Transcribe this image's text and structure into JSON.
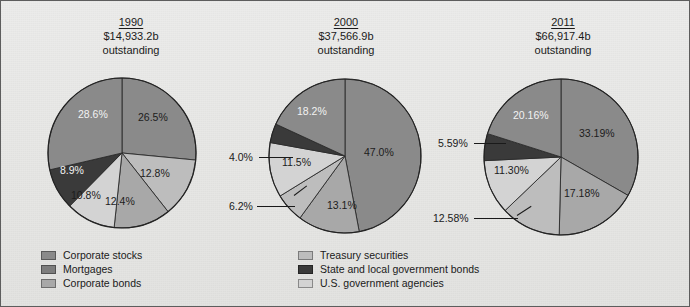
{
  "figure": {
    "background_color": "#e9e9e7",
    "border_color": "#5d5d5d"
  },
  "palette": {
    "corporate_stocks": "#8a8a8a",
    "mortgages": "#8a8a8a",
    "corporate_bonds": "#a8a8a8",
    "treasury_securities": "#bdbdbd",
    "state_local_bonds": "#3a3a3a",
    "us_government_agencies": "#d3d3d3"
  },
  "legend": {
    "left_column": [
      {
        "label": "Corporate stocks",
        "color": "#8a8a8a",
        "key": "corporate_stocks"
      },
      {
        "label": "Mortgages",
        "color": "#7d7d7d",
        "key": "mortgages"
      },
      {
        "label": "Corporate bonds",
        "color": "#a8a8a8",
        "key": "corporate_bonds"
      }
    ],
    "right_column": [
      {
        "label": "Treasury securities",
        "color": "#bdbdbd",
        "key": "treasury_securities"
      },
      {
        "label": "State and local government bonds",
        "color": "#3a3a3a",
        "key": "state_local_bonds"
      },
      {
        "label": "U.S. government agencies",
        "color": "#d3d3d3",
        "key": "us_government_agencies"
      }
    ]
  },
  "panels": [
    {
      "year": "1990",
      "amount": "$14,933.2b",
      "outstanding": "outstanding"
    },
    {
      "year": "2000",
      "amount": "$37,566.9b",
      "outstanding": "outstanding"
    },
    {
      "year": "2011",
      "amount": "$66,917.4b",
      "outstanding": "outstanding"
    }
  ],
  "chart_data": {
    "type": "pie",
    "title": "",
    "legend_position": "bottom",
    "grid": false,
    "charts": [
      {
        "title": "1990",
        "subtitle": "$14,933.2b outstanding",
        "total_label": "$14,933.2b",
        "labels": [
          "Corporate stocks",
          "Treasury securities",
          "Corporate bonds",
          "U.S. government agencies",
          "State and local government bonds",
          "Mortgages"
        ],
        "values": [
          26.5,
          12.8,
          12.4,
          10.8,
          8.9,
          28.6
        ],
        "value_labels": [
          "26.5%",
          "12.8%",
          "12.4%",
          "10.8%",
          "8.9%",
          "28.6%"
        ],
        "colors": [
          "#8a8a8a",
          "#bdbdbd",
          "#a8a8a8",
          "#d3d3d3",
          "#3a3a3a",
          "#8a8a8a"
        ]
      },
      {
        "title": "2000",
        "subtitle": "$37,566.9b outstanding",
        "total_label": "$37,566.9b",
        "labels": [
          "Corporate stocks",
          "Corporate bonds",
          "Treasury securities",
          "U.S. government agencies",
          "State and local government bonds",
          "Mortgages"
        ],
        "values": [
          47.0,
          13.1,
          6.2,
          11.5,
          4.0,
          18.2
        ],
        "value_labels": [
          "47.0%",
          "13.1%",
          "6.2%",
          "11.5%",
          "4.0%",
          "18.2%"
        ],
        "colors": [
          "#8a8a8a",
          "#a8a8a8",
          "#bdbdbd",
          "#d3d3d3",
          "#3a3a3a",
          "#8a8a8a"
        ]
      },
      {
        "title": "2011",
        "subtitle": "$66,917.4b outstanding",
        "total_label": "$66,917.4b",
        "labels": [
          "Corporate stocks",
          "Corporate bonds",
          "Treasury securities",
          "U.S. government agencies",
          "State and local government bonds",
          "Mortgages"
        ],
        "values": [
          33.19,
          17.18,
          12.58,
          11.3,
          5.59,
          20.16
        ],
        "value_labels": [
          "33.19%",
          "17.18%",
          "12.58%",
          "11.30%",
          "5.59%",
          "20.16%"
        ],
        "colors": [
          "#8a8a8a",
          "#a8a8a8",
          "#bdbdbd",
          "#d3d3d3",
          "#3a3a3a",
          "#8a8a8a"
        ]
      }
    ]
  },
  "slice_labels": {
    "p1990": {
      "s1": "26.5%",
      "s2": "12.8%",
      "s3": "12.4%",
      "s4": "10.8%",
      "s5": "8.9%",
      "s6": "28.6%"
    },
    "p2000": {
      "s1": "47.0%",
      "s2": "13.1%",
      "s3": "6.2%",
      "s4": "11.5%",
      "s5": "4.0%",
      "s6": "18.2%"
    },
    "p2011": {
      "s1": "33.19%",
      "s2": "17.18%",
      "s3": "12.58%",
      "s4": "11.30%",
      "s5": "5.59%",
      "s6": "20.16%"
    }
  }
}
